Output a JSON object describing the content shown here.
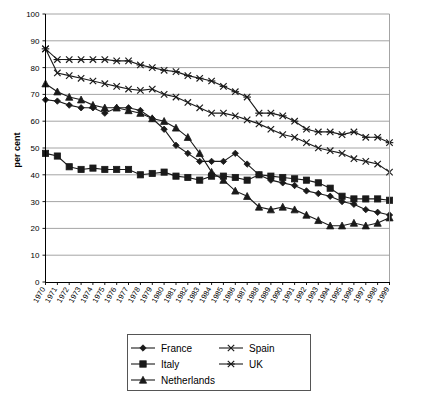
{
  "chart_data": {
    "type": "line",
    "title": "",
    "xlabel": "",
    "ylabel": "per cent",
    "ylim": [
      0,
      100
    ],
    "ytick_step": 10,
    "yticks": [
      0,
      10,
      20,
      30,
      40,
      50,
      60,
      70,
      80,
      90,
      100
    ],
    "grid": true,
    "legend_position": "bottom",
    "x": [
      1970,
      1971,
      1972,
      1973,
      1974,
      1975,
      1976,
      1977,
      1978,
      1979,
      1980,
      1981,
      1982,
      1983,
      1984,
      1985,
      1986,
      1987,
      1988,
      1989,
      1990,
      1991,
      1992,
      1993,
      1994,
      1995,
      1996,
      1997,
      1998,
      1999
    ],
    "categories": [
      "1970",
      "1971",
      "1972",
      "1973",
      "1974",
      "1975",
      "1976",
      "1977",
      "1978",
      "1979",
      "1980",
      "1981",
      "1982",
      "1983",
      "1984",
      "1985",
      "1986",
      "1987",
      "1988",
      "1989",
      "1990",
      "1991",
      "1992",
      "1993",
      "1994",
      "1995",
      "1996",
      "1997",
      "1998",
      "1999"
    ],
    "series": [
      {
        "name": "France",
        "marker": "diamond",
        "values": [
          68,
          67.5,
          66,
          65,
          65,
          63,
          65,
          65,
          64,
          61,
          57,
          51,
          48,
          45,
          45,
          45,
          48,
          44,
          40,
          38,
          37,
          36,
          34,
          33,
          32,
          30,
          29,
          27,
          26,
          25
        ]
      },
      {
        "name": "Italy",
        "marker": "square",
        "values": [
          48,
          47,
          43,
          42,
          42.5,
          42,
          42,
          42,
          40,
          40.5,
          41,
          39.5,
          39,
          38,
          39.5,
          39.5,
          39,
          38,
          40,
          39.5,
          39,
          38.5,
          38,
          37,
          35,
          32,
          31,
          31,
          31,
          30.5
        ]
      },
      {
        "name": "Netherlands",
        "marker": "triangle",
        "values": [
          74,
          71,
          69,
          68,
          66,
          65,
          65,
          64,
          63,
          61,
          60,
          57.5,
          54,
          48,
          41,
          38,
          34,
          32,
          28,
          27,
          28,
          27,
          25,
          23,
          21,
          21,
          22,
          21,
          22,
          24
        ]
      },
      {
        "name": "Spain",
        "marker": "cross",
        "values": [
          87,
          78,
          77,
          76,
          75,
          74,
          73,
          72,
          71.5,
          72,
          70,
          69,
          67,
          65,
          63,
          63,
          62,
          60.5,
          59,
          57,
          55,
          54,
          52,
          50,
          49,
          48,
          46,
          45,
          44,
          41
        ]
      },
      {
        "name": "UK",
        "marker": "asterisk",
        "values": [
          87,
          83,
          83,
          83,
          83,
          83,
          82.5,
          82.5,
          81,
          80,
          79,
          78.5,
          77,
          76,
          75,
          73,
          71,
          69,
          63,
          63,
          62,
          60,
          57,
          56,
          56,
          55,
          56,
          54,
          54,
          52
        ]
      }
    ]
  },
  "legend": {
    "items": [
      {
        "label": "France",
        "marker": "diamond"
      },
      {
        "label": "Spain",
        "marker": "cross"
      },
      {
        "label": "Italy",
        "marker": "square"
      },
      {
        "label": "UK",
        "marker": "asterisk"
      },
      {
        "label": "Netherlands",
        "marker": "triangle"
      }
    ]
  }
}
